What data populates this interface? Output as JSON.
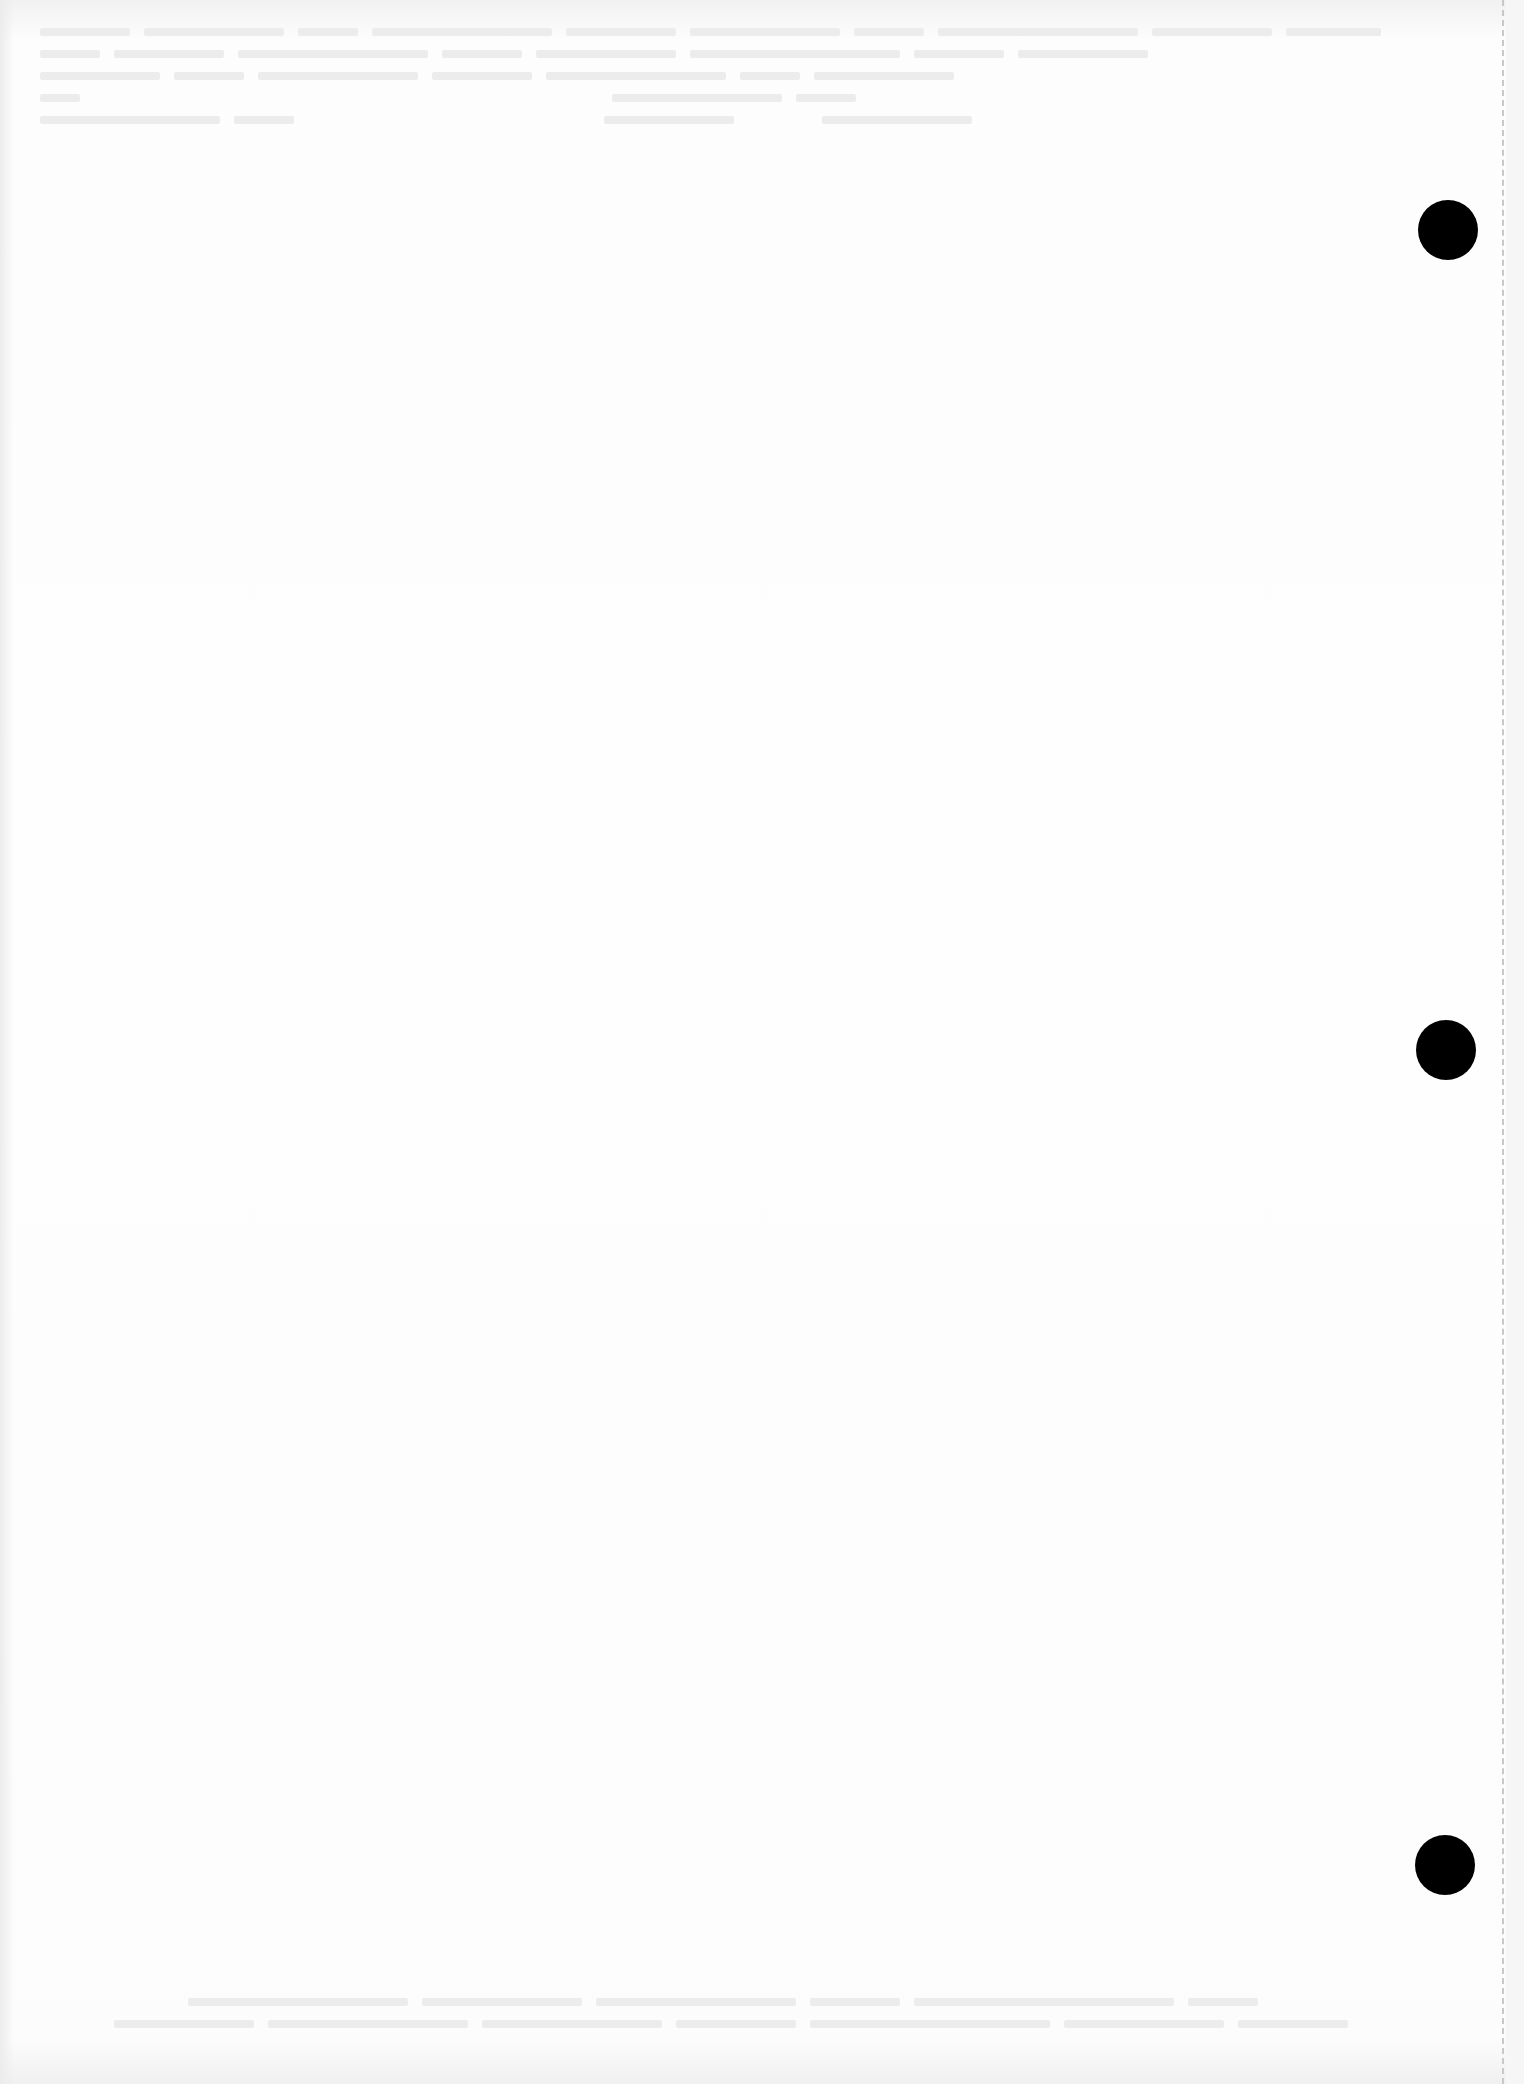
{
  "document": {
    "type": "scanned-page-reverse-side",
    "legible_text": "",
    "background_color": "#fbfbfb",
    "bleed_through_color": "#e4e4e4"
  },
  "bleed_through": {
    "top_rows": [
      {
        "bars": [
          90,
          140,
          60,
          180,
          110,
          150,
          70,
          200,
          120,
          95
        ]
      },
      {
        "bars": [
          60,
          110,
          190,
          80,
          140,
          210,
          90,
          130
        ]
      },
      {
        "bars": [
          120,
          70,
          160,
          100,
          180,
          60,
          140
        ]
      },
      {
        "bars": [
          40,
          0,
          0,
          0,
          0,
          0,
          0,
          0,
          170,
          60
        ]
      },
      {
        "bars": [
          180,
          60,
          0,
          0,
          0,
          0,
          130,
          0,
          150
        ]
      }
    ],
    "bottom_rows": [
      {
        "bars": [
          0,
          0,
          220,
          160,
          200,
          90,
          260,
          70
        ]
      },
      {
        "bars": [
          0,
          140,
          200,
          180,
          120,
          240,
          160,
          110
        ]
      }
    ]
  },
  "punch_holes": [
    {
      "id": "top",
      "left": 1418,
      "top": 200,
      "color": "#000000"
    },
    {
      "id": "middle",
      "left": 1416,
      "top": 1020,
      "color": "#000000"
    },
    {
      "id": "bottom",
      "left": 1415,
      "top": 1835,
      "color": "#000000"
    }
  ],
  "perforation": {
    "x": 1502,
    "style": "dashed",
    "color": "#c8c8c8"
  }
}
